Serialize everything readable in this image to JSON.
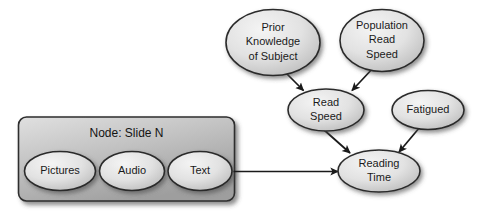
{
  "diagram": {
    "background_color": "#ffffff",
    "ellipse_fill_light": "#f0f0f0",
    "ellipse_fill_dark": "#c4c4c4",
    "ellipse_stroke": "#2b2b2b",
    "container_fill_light": "#d8d8d8",
    "container_fill_dark": "#a8a8a8",
    "container_stroke": "#2b2b2b",
    "edge_color": "#1a1a1a",
    "container": {
      "label": "Node: Slide N",
      "children": [
        {
          "id": "pictures",
          "label": "Pictures"
        },
        {
          "id": "audio",
          "label": "Audio"
        },
        {
          "id": "text",
          "label": "Text"
        }
      ]
    },
    "nodes": [
      {
        "id": "prior-knowledge",
        "lines": [
          "Prior",
          "Knowledge",
          "of Subject"
        ]
      },
      {
        "id": "population-read-speed",
        "lines": [
          "Population",
          "Read",
          "Speed"
        ]
      },
      {
        "id": "read-speed",
        "lines": [
          "Read",
          "Speed"
        ]
      },
      {
        "id": "fatigued",
        "lines": [
          "Fatigued"
        ]
      },
      {
        "id": "reading-time",
        "lines": [
          "Reading",
          "Time"
        ]
      }
    ],
    "edges": [
      {
        "from": "prior-knowledge",
        "to": "read-speed"
      },
      {
        "from": "population-read-speed",
        "to": "read-speed"
      },
      {
        "from": "read-speed",
        "to": "reading-time"
      },
      {
        "from": "fatigued",
        "to": "reading-time"
      },
      {
        "from": "text",
        "to": "reading-time"
      }
    ]
  }
}
